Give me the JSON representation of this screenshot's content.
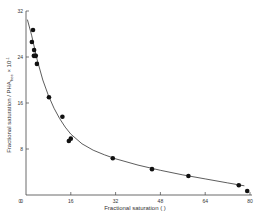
{
  "chart_data": {
    "type": "scatter",
    "title": "",
    "xlabel": "Fractional saturation ( )",
    "ylabel": "Fractional saturation / PHA_free × 10^-1",
    "xlim": [
      0,
      80
    ],
    "ylim": [
      0,
      32
    ],
    "xticks": [
      0,
      16,
      32,
      48,
      64,
      80
    ],
    "yticks": [
      0,
      8,
      16,
      24,
      32
    ],
    "x_tick_labels": [
      "0",
      "16",
      "32",
      "48",
      "64",
      "80"
    ],
    "y_tick_labels": [
      "0",
      "8",
      "16",
      "24",
      "32"
    ],
    "grid": false,
    "legend": null,
    "series": [
      {
        "name": "observed",
        "marker": "filled-circle",
        "color": "#111111",
        "points": [
          [
            2.5,
            28.7
          ],
          [
            2.1,
            26.6
          ],
          [
            2.9,
            25.2
          ],
          [
            2.8,
            24.2
          ],
          [
            3.5,
            24.2
          ],
          [
            3.2,
            24.2
          ],
          [
            3.9,
            22.8
          ],
          [
            8.2,
            17.0
          ],
          [
            13.0,
            13.6
          ],
          [
            15.3,
            9.4
          ],
          [
            16.0,
            9.8
          ],
          [
            31.0,
            6.4
          ],
          [
            45.0,
            4.5
          ],
          [
            58.0,
            3.3
          ],
          [
            76.0,
            1.7
          ],
          [
            79.0,
            0.7
          ]
        ]
      },
      {
        "name": "fitted curve",
        "line": "solid",
        "color": "#333333",
        "points": [
          [
            0.5,
            30.5
          ],
          [
            2,
            27.8
          ],
          [
            4,
            23.5
          ],
          [
            6,
            20.0
          ],
          [
            8,
            17.3
          ],
          [
            10,
            15.1
          ],
          [
            12,
            13.3
          ],
          [
            14,
            11.8
          ],
          [
            16,
            10.6
          ],
          [
            20,
            8.9
          ],
          [
            24,
            7.8
          ],
          [
            28,
            7.0
          ],
          [
            32,
            6.3
          ],
          [
            40,
            5.2
          ],
          [
            48,
            4.3
          ],
          [
            56,
            3.5
          ],
          [
            64,
            2.8
          ],
          [
            72,
            2.1
          ],
          [
            78,
            1.6
          ]
        ]
      }
    ]
  }
}
